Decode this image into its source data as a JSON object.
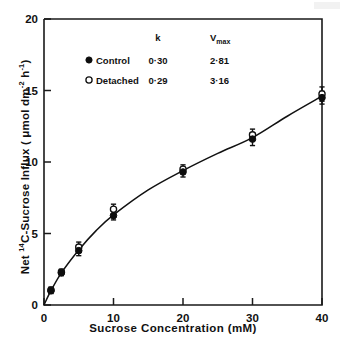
{
  "chart_data": {
    "type": "scatter",
    "title": "",
    "xlabel": "Sucrose Concentration  (mM)",
    "ylabel": "Net 14C-Sucrose Influx ( μmol dm-2 h-1)",
    "xlim": [
      0,
      40
    ],
    "ylim": [
      0,
      20
    ],
    "xticks": [
      0,
      10,
      20,
      30,
      40
    ],
    "yticks": [
      0,
      5,
      10,
      15,
      20
    ],
    "xtick_labels": [
      "0",
      "10",
      "20",
      "30",
      "40"
    ],
    "ytick_labels": [
      "0",
      "5",
      "10",
      "15",
      "20"
    ],
    "grid": false,
    "legend_position": "upper-center",
    "x": [
      1,
      2.5,
      5,
      10,
      20,
      30,
      40
    ],
    "series": [
      {
        "name": "Control",
        "marker": "filled-circle",
        "values": [
          1.0,
          2.25,
          3.8,
          6.25,
          9.3,
          11.6,
          14.5
        ],
        "errors": [
          0.2,
          0.2,
          0.35,
          0.3,
          0.35,
          0.45,
          0.45
        ]
      },
      {
        "name": "Detached",
        "marker": "open-circle",
        "values": [
          1.05,
          2.3,
          4.05,
          6.7,
          9.5,
          11.9,
          14.75
        ],
        "errors": [
          0.2,
          0.2,
          0.35,
          0.35,
          0.3,
          0.4,
          0.5
        ]
      }
    ],
    "fit_curve": {
      "description": "Michaelis-Menten plus linear diffusion fit through both series",
      "points": [
        [
          0,
          0
        ],
        [
          1,
          1.0
        ],
        [
          2.5,
          2.25
        ],
        [
          5,
          3.85
        ],
        [
          7.5,
          5.2
        ],
        [
          10,
          6.3
        ],
        [
          15,
          8.05
        ],
        [
          20,
          9.4
        ],
        [
          25,
          10.6
        ],
        [
          30,
          11.7
        ],
        [
          35,
          13.2
        ],
        [
          40,
          14.6
        ]
      ]
    },
    "legend_table": {
      "columns": [
        "",
        "k",
        "Vmax"
      ],
      "column_labels": [
        "",
        "k",
        "V"
      ],
      "vmax_sub": "max",
      "rows": [
        {
          "marker": "filled-circle",
          "label": "Control",
          "k": "0·30",
          "vmax": "2·81"
        },
        {
          "marker": "open-circle",
          "label": "Detached",
          "k": "0·29",
          "vmax": "3·16"
        }
      ]
    },
    "ylabel_parts": {
      "prefix": "Net ",
      "iso_sup": "14",
      "mid": "C-Sucrose  Influx ( ",
      "umol": "μmol dm",
      "dm_sup": "-2",
      "h": " h",
      "h_sup": "-1",
      "suffix": ")"
    },
    "colors": {
      "axis": "#1a1a1a",
      "curve": "#111111",
      "marker_filled": "#0d0d0d",
      "marker_open_fill": "#ffffff",
      "background": "#ffffff"
    }
  }
}
